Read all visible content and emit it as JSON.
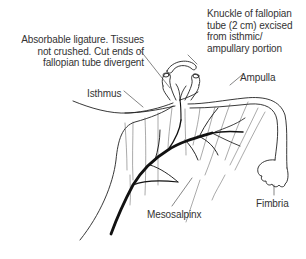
{
  "diagram": {
    "annotations": {
      "ligature": {
        "lines": [
          "Absorbable ligature. Tissues",
          "not crushed. Cut ends of",
          "fallopian tube divergent"
        ]
      },
      "knuckle": {
        "lines": [
          "Knuckle of fallopian",
          "tube (2 cm) excised",
          "from isthmic/",
          "ampullary portion"
        ]
      }
    },
    "labels": {
      "isthmus": "Isthmus",
      "ampulla": "Ampulla",
      "fimbria": "Fimbria",
      "mesosalpinx": "Mesosalpinx"
    },
    "colors": {
      "line": "#222222",
      "vessel": "#111111",
      "background": "#ffffff"
    }
  }
}
